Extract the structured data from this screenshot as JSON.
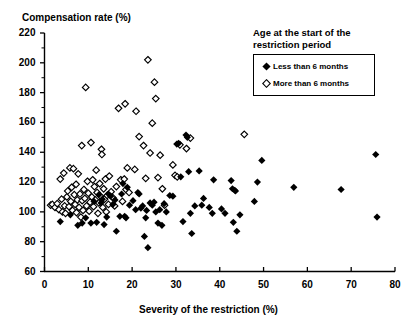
{
  "chart_data": {
    "type": "scatter",
    "title": "",
    "xlabel": "Severity of the restriction (%)",
    "ylabel": "Compensation rate (%)",
    "xlim": [
      0,
      80
    ],
    "ylim": [
      60,
      220
    ],
    "xticks": [
      0,
      10,
      20,
      30,
      40,
      50,
      60,
      70,
      80
    ],
    "yticks": [
      60,
      80,
      100,
      120,
      140,
      160,
      180,
      200,
      220
    ],
    "y_minor_step": 10,
    "grid": false,
    "legend_position": "top-right",
    "legend_title": "Age at the start of the restriction period",
    "series": [
      {
        "name": "Less than 6 months",
        "marker": "filled-diamond",
        "color": "#000000",
        "points": [
          [
            3.6,
            93.5
          ],
          [
            5.9,
            98.0
          ],
          [
            7.6,
            91.0
          ],
          [
            8.6,
            92.5
          ],
          [
            9.4,
            96.0
          ],
          [
            10.6,
            92.5
          ],
          [
            11.3,
            107.0
          ],
          [
            11.9,
            93.0
          ],
          [
            12.4,
            111.5
          ],
          [
            12.9,
            106.0
          ],
          [
            13.2,
            108.5
          ],
          [
            13.6,
            91.5
          ],
          [
            14.2,
            96.5
          ],
          [
            14.6,
            112.0
          ],
          [
            15.1,
            110.5
          ],
          [
            15.6,
            105.0
          ],
          [
            16.1,
            108.0
          ],
          [
            16.4,
            87.0
          ],
          [
            17.2,
            97.0
          ],
          [
            17.6,
            112.0
          ],
          [
            17.9,
            119.0
          ],
          [
            18.3,
            97.0
          ],
          [
            18.6,
            96.0
          ],
          [
            18.9,
            116.5
          ],
          [
            19.4,
            104.5
          ],
          [
            20.2,
            107.5
          ],
          [
            20.8,
            101.5
          ],
          [
            21.3,
            113.0
          ],
          [
            21.6,
            112.0
          ],
          [
            22.0,
            102.5
          ],
          [
            22.4,
            104.0
          ],
          [
            22.8,
            83.5
          ],
          [
            23.1,
            96.0
          ],
          [
            23.3,
            101.0
          ],
          [
            23.6,
            76.0
          ],
          [
            24.1,
            106.0
          ],
          [
            24.6,
            104.5
          ],
          [
            25.0,
            106.5
          ],
          [
            25.4,
            100.0
          ],
          [
            25.9,
            92.5
          ],
          [
            26.3,
            101.5
          ],
          [
            26.8,
            91.0
          ],
          [
            27.3,
            105.5
          ],
          [
            27.8,
            100.0
          ],
          [
            28.6,
            111.0
          ],
          [
            29.3,
            110.5
          ],
          [
            30.2,
            145.5
          ],
          [
            30.6,
            146.0
          ],
          [
            31.1,
            123.5
          ],
          [
            31.6,
            93.5
          ],
          [
            32.3,
            151.5
          ],
          [
            32.6,
            150.0
          ],
          [
            32.9,
            127.0
          ],
          [
            33.3,
            99.0
          ],
          [
            33.6,
            85.5
          ],
          [
            34.3,
            104.0
          ],
          [
            35.3,
            127.5
          ],
          [
            35.9,
            104.5
          ],
          [
            36.3,
            109.0
          ],
          [
            37.6,
            103.0
          ],
          [
            38.3,
            99.0
          ],
          [
            38.6,
            121.5
          ],
          [
            40.4,
            102.0
          ],
          [
            41.2,
            99.0
          ],
          [
            42.6,
            121.0
          ],
          [
            42.9,
            115.5
          ],
          [
            43.1,
            93.0
          ],
          [
            43.4,
            114.5
          ],
          [
            43.6,
            114.0
          ],
          [
            43.9,
            87.0
          ],
          [
            44.6,
            98.0
          ],
          [
            47.9,
            107.0
          ],
          [
            48.6,
            120.0
          ],
          [
            49.6,
            134.5
          ],
          [
            56.9,
            116.5
          ],
          [
            67.7,
            115.0
          ],
          [
            75.6,
            138.5
          ],
          [
            75.9,
            96.5
          ]
        ]
      },
      {
        "name": "More than 6 months",
        "marker": "open-diamond",
        "color": "#000000",
        "points": [
          [
            1.4,
            104.5
          ],
          [
            1.8,
            105.0
          ],
          [
            2.4,
            103.0
          ],
          [
            2.9,
            105.5
          ],
          [
            3.3,
            101.5
          ],
          [
            3.6,
            122.0
          ],
          [
            3.9,
            108.5
          ],
          [
            4.1,
            100.0
          ],
          [
            4.4,
            126.0
          ],
          [
            4.6,
            104.0
          ],
          [
            4.8,
            99.0
          ],
          [
            5.1,
            110.0
          ],
          [
            5.3,
            114.0
          ],
          [
            5.6,
            103.5
          ],
          [
            5.8,
            129.5
          ],
          [
            6.0,
            107.0
          ],
          [
            6.2,
            116.5
          ],
          [
            6.4,
            101.0
          ],
          [
            6.6,
            129.0
          ],
          [
            6.8,
            111.5
          ],
          [
            7.0,
            105.0
          ],
          [
            7.2,
            118.5
          ],
          [
            7.3,
            99.5
          ],
          [
            7.5,
            108.0
          ],
          [
            7.7,
            125.5
          ],
          [
            7.9,
            103.0
          ],
          [
            8.1,
            112.0
          ],
          [
            8.3,
            96.5
          ],
          [
            8.5,
            144.5
          ],
          [
            8.6,
            107.5
          ],
          [
            8.8,
            101.0
          ],
          [
            9.0,
            115.0
          ],
          [
            9.2,
            109.0
          ],
          [
            9.4,
            183.5
          ],
          [
            9.6,
            104.0
          ],
          [
            9.8,
            120.5
          ],
          [
            10.0,
            112.5
          ],
          [
            10.2,
            100.5
          ],
          [
            10.4,
            106.5
          ],
          [
            10.6,
            146.5
          ],
          [
            10.8,
            110.0
          ],
          [
            11.0,
            121.5
          ],
          [
            11.2,
            103.5
          ],
          [
            11.4,
            117.0
          ],
          [
            11.6,
            108.0
          ],
          [
            11.8,
            128.0
          ],
          [
            12.0,
            113.0
          ],
          [
            12.2,
            99.0
          ],
          [
            12.4,
            106.0
          ],
          [
            12.6,
            119.0
          ],
          [
            12.8,
            110.5
          ],
          [
            13.0,
            142.0
          ],
          [
            13.1,
            138.5
          ],
          [
            13.3,
            103.0
          ],
          [
            13.5,
            115.5
          ],
          [
            13.7,
            108.5
          ],
          [
            13.9,
            122.0
          ],
          [
            14.1,
            100.0
          ],
          [
            14.3,
            111.0
          ],
          [
            14.6,
            105.0
          ],
          [
            14.8,
            124.0
          ],
          [
            15.2,
            113.5
          ],
          [
            15.6,
            109.5
          ],
          [
            16.0,
            104.0
          ],
          [
            16.4,
            117.0
          ],
          [
            16.9,
            169.5
          ],
          [
            17.4,
            121.5
          ],
          [
            17.8,
            107.0
          ],
          [
            18.2,
            122.0
          ],
          [
            18.4,
            172.5
          ],
          [
            18.6,
            115.0
          ],
          [
            18.9,
            129.5
          ],
          [
            19.3,
            113.0
          ],
          [
            20.6,
            128.5
          ],
          [
            20.9,
            167.5
          ],
          [
            21.6,
            150.5
          ],
          [
            22.6,
            144.5
          ],
          [
            23.1,
            122.5
          ],
          [
            23.6,
            202.0
          ],
          [
            24.1,
            139.5
          ],
          [
            24.6,
            159.5
          ],
          [
            25.1,
            187.0
          ],
          [
            25.4,
            176.0
          ],
          [
            25.9,
            123.0
          ],
          [
            26.4,
            138.0
          ],
          [
            26.9,
            115.5
          ],
          [
            27.4,
            104.5
          ],
          [
            29.3,
            131.5
          ],
          [
            29.8,
            124.5
          ],
          [
            30.3,
            123.5
          ],
          [
            30.9,
            145.0
          ],
          [
            32.4,
            142.5
          ],
          [
            33.3,
            149.5
          ],
          [
            45.6,
            152.0
          ]
        ]
      }
    ]
  },
  "axes": {
    "y_title": "Compensation rate (%)",
    "x_title": "Severity of the restriction (%)",
    "y_tick_labels": [
      "220",
      "200",
      "180",
      "160",
      "140",
      "120",
      "100",
      "80",
      "60"
    ],
    "x_tick_labels": [
      "0",
      "10",
      "20",
      "30",
      "40",
      "50",
      "60",
      "70",
      "80"
    ]
  },
  "legend": {
    "title": "Age at the start of the restriction period",
    "entries": [
      {
        "label": "Less than 6 months",
        "marker": "filled-diamond"
      },
      {
        "label": "More than 6 months",
        "marker": "open-diamond"
      }
    ]
  }
}
